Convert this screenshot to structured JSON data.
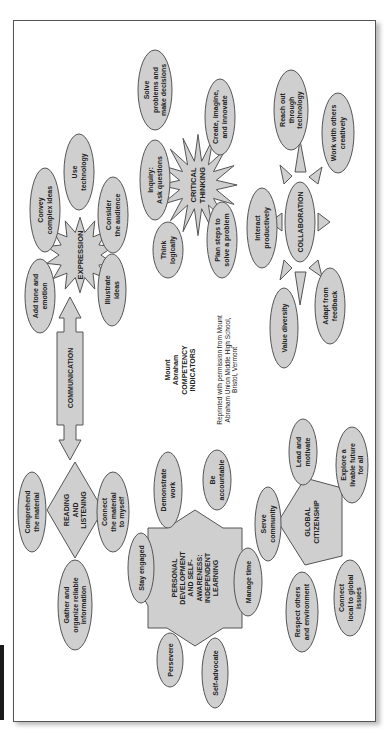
{
  "diagram": {
    "orientation": "rotated-90-ccw",
    "title": {
      "lines": [
        "Mount",
        "Abraham",
        "COMPETENCY",
        "INDICATORS"
      ],
      "credit_lines": [
        "Reprinted with permission from Mount",
        "Abraham Union Middle High School,",
        "Bristol, Vermont"
      ]
    },
    "colors": {
      "node_fill": "#cfcfcf",
      "node_stroke": "#555555",
      "page_border": "#555555",
      "text": "#222222"
    },
    "clusters": {
      "communication": {
        "hub": {
          "label": [
            "COMMUNICATION"
          ],
          "shape": "double-arrow"
        },
        "expression": {
          "hub": {
            "label": [
              "EXPRESSION"
            ],
            "shape": "starburst"
          },
          "nodes": [
            {
              "label": [
                "Convey",
                "complex ideas"
              ]
            },
            {
              "label": [
                "Use",
                "technology"
              ]
            },
            {
              "label": [
                "Consider",
                "the audience"
              ]
            },
            {
              "label": [
                "Add tone and",
                "emotion"
              ]
            },
            {
              "label": [
                "Illustrate",
                "ideas"
              ]
            }
          ]
        },
        "reading": {
          "hub": {
            "label": [
              "READING",
              "AND",
              "LISTENING"
            ],
            "shape": "diamond"
          },
          "nodes": [
            {
              "label": [
                "Comprehend",
                "the material"
              ]
            },
            {
              "label": [
                "Connect",
                "the material",
                "to myself"
              ]
            },
            {
              "label": [
                "Gather and",
                "organize reliable",
                "information"
              ]
            }
          ]
        }
      },
      "critical_thinking": {
        "hub": {
          "label": [
            "CRITICAL",
            "THINKING"
          ],
          "shape": "starburst"
        },
        "nodes": [
          {
            "label": [
              "Solve",
              "problems and",
              "make decisions"
            ]
          },
          {
            "label": [
              "Create, imagine,",
              "and innovate"
            ]
          },
          {
            "label": [
              "Inquiry:",
              "Ask questions"
            ]
          },
          {
            "label": [
              "Think",
              "logically"
            ]
          },
          {
            "label": [
              "Plan steps to",
              "solve a problem"
            ]
          }
        ]
      },
      "collaboration": {
        "hub": {
          "label": [
            "COLLABORATION"
          ],
          "shape": "sun"
        },
        "nodes": [
          {
            "label": [
              "Reach out",
              "through",
              "technology"
            ]
          },
          {
            "label": [
              "Work with others",
              "creatively"
            ]
          },
          {
            "label": [
              "Interact",
              "productively"
            ]
          },
          {
            "label": [
              "Value diversity"
            ]
          },
          {
            "label": [
              "Adapt from",
              "feedback"
            ]
          }
        ]
      },
      "personal_development": {
        "hub": {
          "label": [
            "PERSONAL",
            "DEVELOPMENT",
            "AND SELF-",
            "AWARENESS:",
            "INDEPENDENT",
            "LEARNING"
          ],
          "shape": "8-point-star"
        },
        "nodes": [
          {
            "label": [
              "Demonstrate",
              "work"
            ]
          },
          {
            "label": [
              "Be",
              "accountable"
            ]
          },
          {
            "label": [
              "Stay engaged"
            ]
          },
          {
            "label": [
              "Manage time"
            ]
          },
          {
            "label": [
              "Persevere"
            ]
          },
          {
            "label": [
              "Self-advocate"
            ]
          }
        ]
      },
      "global_citizenship": {
        "hub": {
          "label": [
            "GLOBAL",
            "CITIZENSHIP"
          ],
          "shape": "pentagon"
        },
        "nodes": [
          {
            "label": [
              "Serve",
              "community"
            ]
          },
          {
            "label": [
              "Lead and",
              "motivate"
            ]
          },
          {
            "label": [
              "Explore a",
              "livable future",
              "for all"
            ]
          },
          {
            "label": [
              "Respect others",
              "and environment"
            ]
          },
          {
            "label": [
              "Connect",
              "local to global",
              "issues"
            ]
          }
        ]
      }
    }
  }
}
